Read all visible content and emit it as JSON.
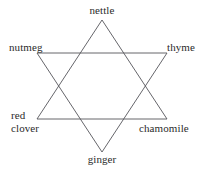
{
  "diagram": {
    "type": "hexagram",
    "title": "",
    "stroke_color": "#55555a",
    "background_color": "#ffffff",
    "text_color": "#2b2b2b",
    "stroke_width": 0.9,
    "nodes": [
      {
        "id": "nettle",
        "label": "nettle",
        "position": "top",
        "vertex": {
          "x": 102,
          "y": 20
        },
        "triangle": "up"
      },
      {
        "id": "nutmeg",
        "label": "nutmeg",
        "position": "upper-left",
        "vertex": {
          "x": 37,
          "y": 53
        },
        "triangle": "down"
      },
      {
        "id": "thyme",
        "label": "thyme",
        "position": "upper-right",
        "vertex": {
          "x": 167,
          "y": 53
        },
        "triangle": "down"
      },
      {
        "id": "red-clover",
        "label": "red clover",
        "label_line1": "red",
        "label_line2": "clover",
        "position": "lower-left",
        "vertex": {
          "x": 37,
          "y": 119
        },
        "triangle": "up"
      },
      {
        "id": "chamomile",
        "label": "chamomile",
        "position": "lower-right",
        "vertex": {
          "x": 167,
          "y": 119
        },
        "triangle": "up"
      },
      {
        "id": "ginger",
        "label": "ginger",
        "position": "bottom",
        "vertex": {
          "x": 102,
          "y": 152
        },
        "triangle": "down"
      }
    ],
    "triangles": [
      {
        "name": "upward-triangle",
        "points": "102,20 37,119 167,119"
      },
      {
        "name": "downward-triangle",
        "points": "37,53 167,53 102,152"
      }
    ]
  }
}
